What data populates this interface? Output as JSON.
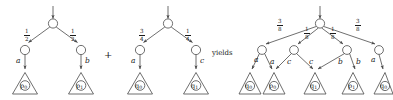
{
  "figure": {
    "kind": "probabilistic-transition-trees",
    "operator_plus": "+",
    "operator_yields": "yields",
    "stroke_color": "#4a4a4a",
    "text_color": "#1a1a1a"
  },
  "trees": [
    {
      "id": "left-tree",
      "name": "first-summand",
      "root_label": "",
      "branches": [
        {
          "probability": {
            "numerator": "1",
            "denominator": "2"
          },
          "action": "a",
          "leaf": {
            "state": "p",
            "index": "0"
          }
        },
        {
          "probability": {
            "numerator": "1",
            "denominator": "2"
          },
          "action": "b",
          "leaf": {
            "state": "p",
            "index": "1"
          }
        }
      ]
    },
    {
      "id": "middle-tree",
      "name": "second-summand",
      "root_label": "",
      "branches": [
        {
          "probability": {
            "numerator": "3",
            "denominator": "4"
          },
          "action": "a",
          "leaf": {
            "state": "q",
            "index": "0"
          }
        },
        {
          "probability": {
            "numerator": "1",
            "denominator": "4"
          },
          "action": "c",
          "leaf": {
            "state": "q",
            "index": "1"
          }
        }
      ]
    },
    {
      "id": "right-tree",
      "name": "result-tree",
      "root_label": "",
      "branches": [
        {
          "probability": {
            "numerator": "3",
            "denominator": "8"
          },
          "actions": [
            "a",
            "a"
          ],
          "leaf": {
            "state": "q",
            "index": "0"
          }
        },
        {
          "probability": {
            "numerator": "1",
            "denominator": "8"
          },
          "actions": [
            "a",
            "c"
          ],
          "leaf": {
            "state": "p",
            "index": "0"
          }
        },
        {
          "probability": {
            "numerator": "1",
            "denominator": "8"
          },
          "actions": [
            "c",
            "b"
          ],
          "leaf": {
            "state": "q",
            "index": "1"
          }
        },
        {
          "probability": {
            "numerator": "3",
            "denominator": "8"
          },
          "actions": [
            "b",
            "a"
          ],
          "leaf": {
            "state": "p",
            "index": "1"
          }
        }
      ],
      "extra_leaf": {
        "state": "q",
        "index": "0"
      }
    }
  ],
  "labels": {
    "left_actions": [
      "a",
      "b"
    ],
    "middle_actions": [
      "a",
      "c"
    ],
    "right_actions": [
      "a",
      "a",
      "c",
      "c",
      "b",
      "b",
      "a"
    ],
    "left_leaves": [
      "p0",
      "p1"
    ],
    "middle_leaves": [
      "q0",
      "q1"
    ],
    "right_leaves": [
      "q0",
      "p0",
      "q1",
      "p1",
      "q0"
    ],
    "left_fractions": [
      "1/2",
      "1/2"
    ],
    "middle_fractions": [
      "3/4",
      "1/4"
    ],
    "right_fractions": [
      "3/8",
      "1/8",
      "1/8",
      "3/8"
    ]
  }
}
